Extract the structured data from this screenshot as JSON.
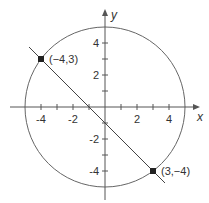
{
  "figure": {
    "axes": {
      "x_label": "x",
      "y_label": "y",
      "x_ticks": [
        "-4",
        "-2",
        "2",
        "4"
      ],
      "y_ticks": [
        "4",
        "2",
        "-2",
        "-4"
      ]
    },
    "circle": {
      "center": [
        0,
        0
      ],
      "radius": 5
    },
    "line": {
      "through": [
        [
          -4,
          3
        ],
        [
          3,
          -4
        ]
      ],
      "equation": "y = -x - 1"
    },
    "points": [
      {
        "label": "(−4,3)",
        "x": -4,
        "y": 3
      },
      {
        "label": "(3,−4)",
        "x": 3,
        "y": -4
      }
    ],
    "colors": {
      "stroke": "#555555",
      "point": "#222222"
    }
  }
}
